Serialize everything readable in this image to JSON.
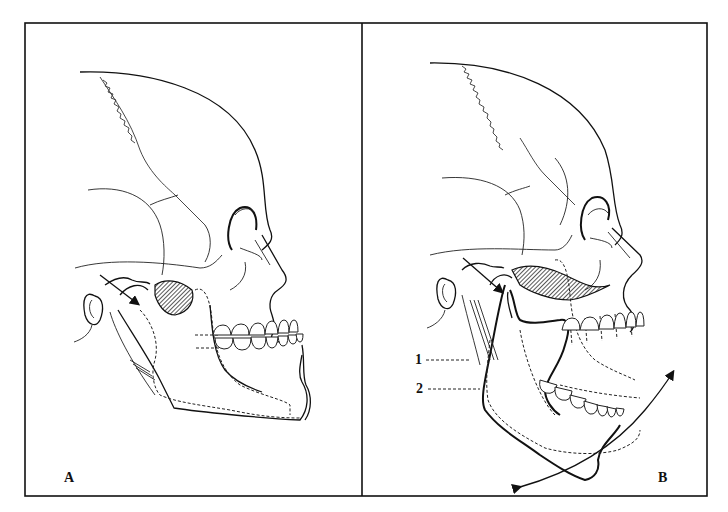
{
  "figure": {
    "panels": [
      {
        "id": "A",
        "label": "A",
        "caption_position": "bottom-left"
      },
      {
        "id": "B",
        "label": "B",
        "caption_position": "bottom-right"
      }
    ],
    "callouts": [
      {
        "label": "1",
        "panel": "B"
      },
      {
        "label": "2",
        "panel": "B"
      }
    ],
    "colors": {
      "line": "#111111",
      "background": "#ffffff"
    }
  }
}
